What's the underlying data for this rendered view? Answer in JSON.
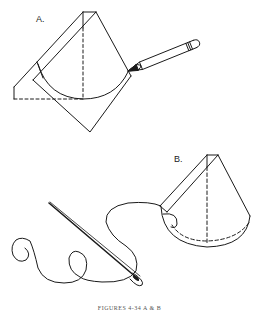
{
  "figure": {
    "panels": [
      {
        "id": "A",
        "label": "A.",
        "description": "Square of material folded into a cone-shaped wedge with a pencil marking a curved hemline arc"
      },
      {
        "id": "B",
        "label": "B.",
        "description": "Cone wedge with curved hem being stitched; needle and thread attached along the dashed stitch line"
      }
    ],
    "caption": "FIGURES 4-34 A & B",
    "colors": {
      "line": "#1a1a1a",
      "background": "#ffffff"
    },
    "icons": [
      "pencil-icon",
      "needle-icon",
      "thread-icon"
    ]
  }
}
